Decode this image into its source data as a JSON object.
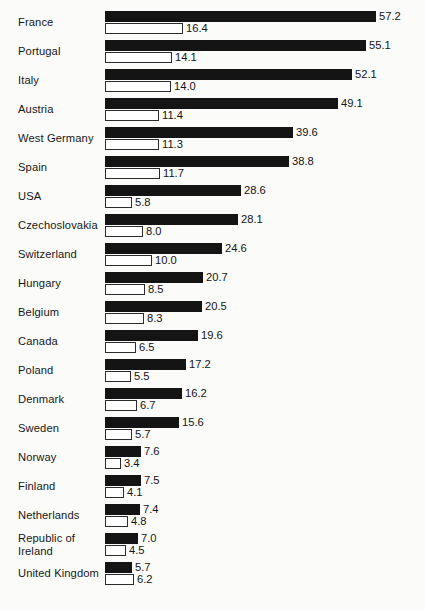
{
  "chart_data": {
    "type": "bar",
    "orientation": "horizontal",
    "title": "",
    "xlabel": "",
    "ylabel": "",
    "grid": false,
    "legend": "none",
    "xlim": [
      0,
      57.2
    ],
    "categories": [
      "France",
      "Portugal",
      "Italy",
      "Austria",
      "West Germany",
      "Spain",
      "USA",
      "Czechoslovakia",
      "Switzerland",
      "Hungary",
      "Belgium",
      "Canada",
      "Poland",
      "Denmark",
      "Sweden",
      "Norway",
      "Finland",
      "Netherlands",
      "Republic of\nIreland",
      "United Kingdom"
    ],
    "series": [
      {
        "name": "series-1-dark",
        "style": "filled-black",
        "values": [
          57.2,
          55.1,
          52.1,
          49.1,
          39.6,
          38.8,
          28.6,
          28.1,
          24.6,
          20.7,
          20.5,
          19.6,
          17.2,
          16.2,
          15.6,
          7.6,
          7.5,
          7.4,
          7.0,
          5.7
        ],
        "labels": [
          "57.2",
          "55.1",
          "52.1",
          "49.1",
          "39.6",
          "38.8",
          "28.6",
          "28.1",
          "24.6",
          "20.7",
          "20.5",
          "19.6",
          "17.2",
          "16.2",
          "15.6",
          "7.6",
          "7.5",
          "7.4",
          "7.0",
          "5.7"
        ]
      },
      {
        "name": "series-2-light",
        "style": "outlined-white",
        "values": [
          16.4,
          14.1,
          14.0,
          11.4,
          11.3,
          11.7,
          5.8,
          8.0,
          10.0,
          8.5,
          8.3,
          6.5,
          5.5,
          6.7,
          5.7,
          3.4,
          4.1,
          4.8,
          4.5,
          6.2
        ],
        "labels": [
          "16.4",
          "14.1",
          "14.0",
          "11.4",
          "11.3",
          "11.7",
          "5.8",
          "8.0",
          "10.0",
          "8.5",
          "8.3",
          "6.5",
          "5.5",
          "6.7",
          "5.7",
          "3.4",
          "4.1",
          "4.8",
          "4.5",
          "6.2"
        ]
      }
    ],
    "colors": {
      "series_1": "#141414",
      "series_2_fill": "#ffffff",
      "series_2_stroke": "#2b2b2b",
      "text": "#141414",
      "background": "#fbfbfa"
    }
  },
  "caption": {
    "text": ""
  }
}
